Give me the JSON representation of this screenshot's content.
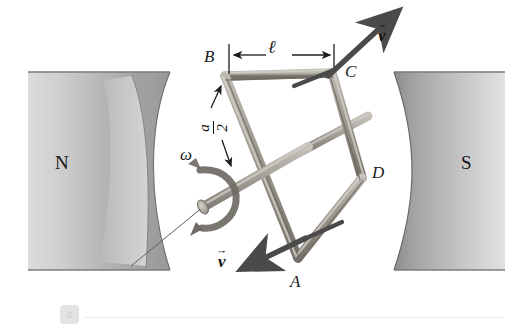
{
  "figure": {
    "type": "physics-diagram",
    "part_label": "a",
    "background_color": "#ffffff"
  },
  "magnets": {
    "north": {
      "label": "N",
      "pole": "north",
      "position": "left",
      "fill": "#b9b9b9"
    },
    "south": {
      "label": "S",
      "pole": "south",
      "position": "right",
      "fill": "#b5b5b5"
    }
  },
  "coil": {
    "name": "rectangular-wire-loop",
    "color": "#9a968f",
    "corners": [
      {
        "label": "A",
        "x": 298,
        "y": 258
      },
      {
        "label": "B",
        "x": 225,
        "y": 76
      },
      {
        "label": "C",
        "x": 332,
        "y": 73
      },
      {
        "label": "D",
        "x": 362,
        "y": 178
      }
    ]
  },
  "axle": {
    "name": "rotation-axle",
    "label": "ω",
    "color": "#a6a29b"
  },
  "dimensions": {
    "length": {
      "symbol": "ℓ",
      "between": [
        "B",
        "C"
      ]
    },
    "half_side": {
      "numerator": "a",
      "denominator": "2",
      "symbol": "a/2"
    }
  },
  "velocity_vectors": [
    {
      "label": "v",
      "at_corner": "C",
      "direction": "up-right"
    },
    {
      "label": "v",
      "at_corner": "A",
      "direction": "down-left"
    }
  ]
}
